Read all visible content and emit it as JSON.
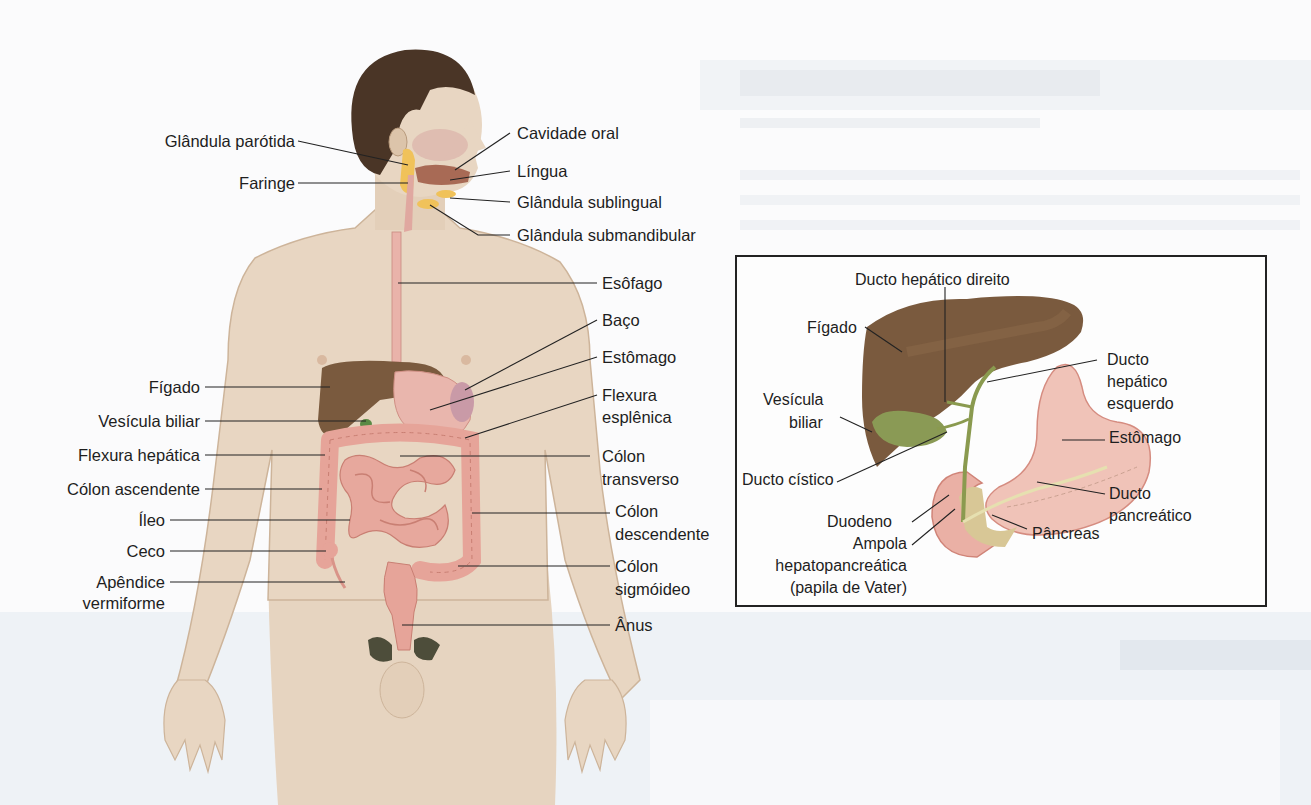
{
  "figure": {
    "type": "anatomical-diagram",
    "main_labels_left": [
      {
        "id": "parotida",
        "text": "Glândula parótida"
      },
      {
        "id": "faringe",
        "text": "Faringe"
      },
      {
        "id": "figado",
        "text": "Fígado"
      },
      {
        "id": "vesicula",
        "text": "Vesícula biliar"
      },
      {
        "id": "flexura_hepatica",
        "text": "Flexura hepática"
      },
      {
        "id": "colon_ascendente",
        "text": "Cólon ascendente"
      },
      {
        "id": "ileo",
        "text": "Íleo"
      },
      {
        "id": "ceco",
        "text": "Ceco"
      },
      {
        "id": "apendice",
        "text": "Apêndice vermiforme",
        "line1": "Apêndice",
        "line2": "vermiforme"
      }
    ],
    "main_labels_right": [
      {
        "id": "cavidade_oral",
        "text": "Cavidade oral"
      },
      {
        "id": "lingua",
        "text": "Língua"
      },
      {
        "id": "sublingual",
        "text": "Glândula sublingual"
      },
      {
        "id": "submandibular",
        "text": "Glândula submandibular"
      },
      {
        "id": "esofago",
        "text": "Esôfago"
      },
      {
        "id": "baco",
        "text": "Baço"
      },
      {
        "id": "estomago",
        "text": "Estômago"
      },
      {
        "id": "flexura_esplenica",
        "text": "Flexura esplênica",
        "line1": "Flexura",
        "line2": "esplênica"
      },
      {
        "id": "colon_transverso",
        "text": "Cólon transverso",
        "line1": "Cólon",
        "line2": "transverso"
      },
      {
        "id": "colon_descendente",
        "text": "Cólon descendente",
        "line1": "Cólon",
        "line2": "descendente"
      },
      {
        "id": "colon_sigmoideo",
        "text": "Cólon sigmóideo",
        "line1": "Cólon",
        "line2": "sigmóideo"
      },
      {
        "id": "anus",
        "text": "Ânus"
      }
    ],
    "inset": {
      "labels": [
        {
          "id": "ducto_hep_dir",
          "text": "Ducto hepático direito"
        },
        {
          "id": "figado",
          "text": "Fígado"
        },
        {
          "id": "ducto_hep_esq",
          "text": "Ducto hepático esquerdo",
          "line1": "Ducto",
          "line2": "hepático",
          "line3": "esquerdo"
        },
        {
          "id": "vesicula",
          "text": "Vesícula biliar",
          "line1": "Vesícula",
          "line2": "biliar"
        },
        {
          "id": "estomago",
          "text": "Estômago"
        },
        {
          "id": "ducto_cistico",
          "text": "Ducto cístico"
        },
        {
          "id": "ducto_pancreatico",
          "text": "Ducto pancreático",
          "line1": "Ducto",
          "line2": "pancreático"
        },
        {
          "id": "duodeno",
          "text": "Duodeno"
        },
        {
          "id": "pancreas",
          "text": "Pâncreas"
        },
        {
          "id": "ampola",
          "text": "Ampola hepatopancreática (papila de Vater)",
          "line1": "Ampola",
          "line2": "hepatopancreática",
          "line3": "(papila de Vater)"
        }
      ]
    },
    "colors": {
      "skin": "#e8d6c2",
      "skin_shadow": "#cdb49a",
      "hair": "#4a3526",
      "liver": "#7a5a3e",
      "liver_light": "#8c6a4a",
      "stomach": "#e9b0a6",
      "intestine": "#e6a499",
      "intestine_dark": "#c97f73",
      "gland": "#f0c25a",
      "gallbladder": "#8a9a55",
      "duct": "#9aa560",
      "pancreas": "#d8c796",
      "line": "#222222"
    }
  }
}
